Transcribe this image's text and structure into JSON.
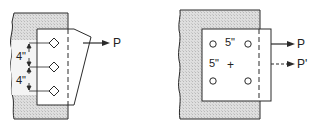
{
  "figure": {
    "left_diagram": {
      "description": "Bracket plate bolted to column flange with three fasteners in a single vertical row",
      "fasteners": 3,
      "fastener_symbol": "diamond",
      "spacing_labels": [
        "4\"",
        "4\""
      ],
      "load_label": "P"
    },
    "right_diagram": {
      "description": "Square plate bolted to column flange with four fasteners in a 2x2 pattern",
      "fasteners": 4,
      "fastener_symbol": "circle",
      "horizontal_spacing_label": "5\"",
      "vertical_spacing_label": "5\"",
      "centroid_symbol": "+",
      "load_labels": [
        "P",
        "P'"
      ]
    },
    "colors": {
      "line": "#2a2a2a",
      "shade": "#d6d6d6",
      "plate": "#ffffff"
    }
  }
}
